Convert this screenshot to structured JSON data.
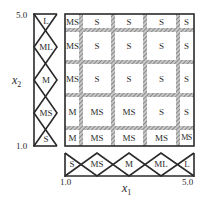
{
  "axes": {
    "x1": {
      "label": "x",
      "sub": "1",
      "min_label": "1.0",
      "max_label": "5.0"
    },
    "x2": {
      "label": "x",
      "sub": "2",
      "min_label": "1.0",
      "max_label": "5.0"
    }
  },
  "x1_sets": [
    "S",
    "MS",
    "M",
    "ML",
    "L"
  ],
  "x2_sets_top_to_bottom": [
    "L",
    "ML",
    "M",
    "MS",
    "S"
  ],
  "rule_grid": {
    "rows_top_to_bottom": [
      [
        "MS",
        "S",
        "S",
        "S",
        "S"
      ],
      [
        "MS",
        "S",
        "S",
        "S",
        "S"
      ],
      [
        "MS",
        "S",
        "S",
        "S",
        "S"
      ],
      [
        "M",
        "MS",
        "MS",
        "S",
        "S"
      ],
      [
        "M",
        "MS",
        "MS",
        "MS",
        "MS"
      ]
    ]
  },
  "colors": {
    "line": "#2a2a2a",
    "hatch": "#8c8c8c",
    "background": "#ffffff"
  }
}
